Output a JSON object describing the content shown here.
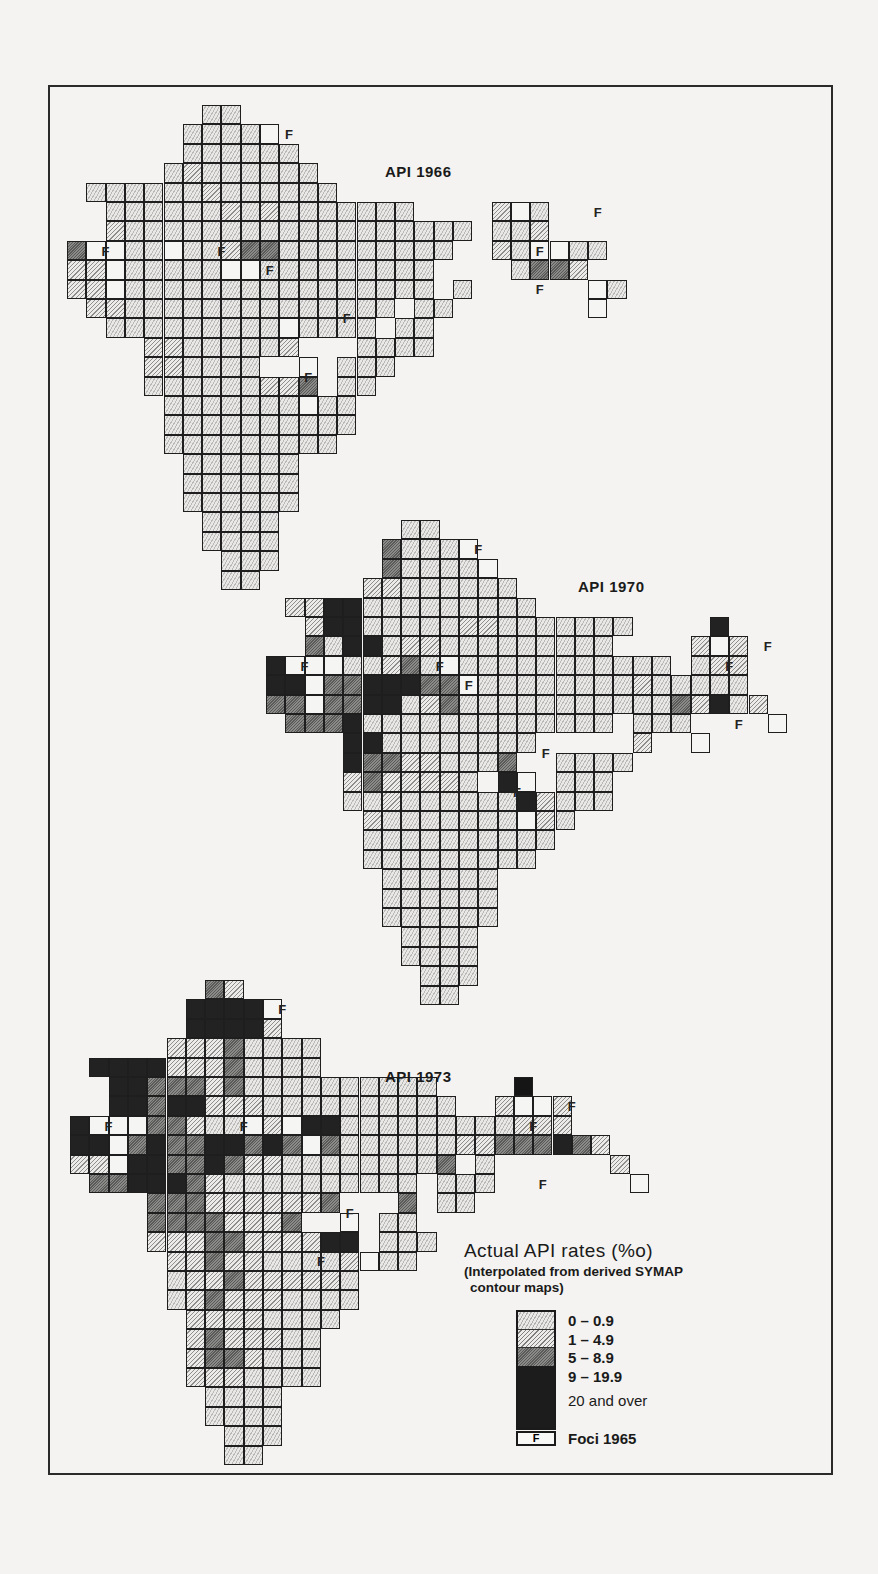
{
  "maps": [
    {
      "id": "m1966",
      "title": "API 1966",
      "origin": [
        67,
        105
      ],
      "title_pos": [
        385,
        163
      ],
      "rows": [
        ".......00",
        "......0000F",
        "......000000",
        ".....01000000",
        ".0000001000000",
        "..0000001010000000....1F0",
        "..1000000000000000000.001",
        "2FF00F00122000000000..10FF00",
        "11F00000FF000000000....0221",
        "11F0000000000000000.0......F0",
        ".1100000000000000.00.......F",
        "..000000000F0000.00",
        "....11000001...0000",
        "....110000..F.000",
        "....000000112.00",
        ".....0000000F00",
        ".....0000000000",
        ".....000000000",
        "......000000",
        "......000000",
        "......000000",
        ".......0000",
        ".......0000",
        "........000",
        "........00"
      ],
      "foci_labels": [
        [
          11,
          1
        ],
        [
          1.5,
          7
        ],
        [
          7.5,
          7
        ],
        [
          10,
          8
        ],
        [
          14,
          10.5
        ],
        [
          12,
          13.5
        ],
        [
          27,
          5
        ],
        [
          24,
          7
        ],
        [
          24,
          9
        ]
      ]
    },
    {
      "id": "m1970",
      "title": "API 1970",
      "origin": [
        266,
        520
      ],
      "title_pos": [
        578,
        578
      ],
      "rows": [
        ".......00",
        "......2000F",
        "......20000F",
        ".....11000000",
        ".1133000000000",
        "..13300000110000000....3",
        "..2033011000000000....1F1",
        "3FFF00120F00000000000.011",
        "33F2233322F00000000100000",
        "22F22330120000000000021301",
        ".22230000000000000.000....F",
        "....3300000000.....1..F",
        "....322110002..0000",
        "....1211110.3F.000",
        "....00100000031000",
        ".....10000000F10",
        ".....0000000000",
        ".....000000000",
        "......000000",
        "......000000",
        "......000000",
        ".......0000",
        ".......0000",
        "........000",
        "........00"
      ],
      "foci_labels": [
        [
          10.5,
          1
        ],
        [
          1.5,
          7
        ],
        [
          8.5,
          7
        ],
        [
          10,
          8
        ],
        [
          14,
          11.5
        ],
        [
          12.5,
          13.5
        ],
        [
          25.5,
          6
        ],
        [
          23.5,
          7
        ],
        [
          24,
          10
        ]
      ]
    },
    {
      "id": "m1973",
      "title": "API 1973",
      "origin": [
        70,
        980
      ],
      "title_pos": [
        385,
        1068
      ],
      "rows": [
        ".......21",
        "......3333F",
        "......33331",
        ".....11120000",
        ".333311120000",
        "..33222120000000000....4",
        "..332331110000000000..1FF1",
        "3FFF22100F1F33000000000111",
        "33F232233232F200000011222321",
        "11F33223211000000002.0......1",
        ".22333210000000000.000.......F",
        "....2221111112...2.00",
        "....22221112..F.00",
        "....11122111133.000",
        ".....1121100001F00",
        ".....0112111110",
        ".....0121110000",
        "......11110000",
        "......1211100",
        "......1221000",
        "......1110000",
        ".......0000",
        ".......0000",
        "........000",
        "........00"
      ],
      "foci_labels": [
        [
          10.5,
          1
        ],
        [
          1.5,
          7
        ],
        [
          8.5,
          7
        ],
        [
          10,
          8
        ],
        [
          14,
          11.5
        ],
        [
          12.5,
          14
        ],
        [
          25.5,
          6
        ],
        [
          23.5,
          7
        ],
        [
          24,
          10
        ]
      ]
    }
  ],
  "legend": {
    "title": "Actual API rates (%o)",
    "subtitle_line1": "(Interpolated from derived SYMAP",
    "subtitle_line2": "contour maps)",
    "classes": [
      {
        "label": "0 – 0.9"
      },
      {
        "label": "1 – 4.9"
      },
      {
        "label": "5 – 8.9"
      },
      {
        "label": "9 – 19.9"
      },
      {
        "label": "20 and over"
      }
    ],
    "foci_symbol": "F",
    "foci_label": "Foci 1965"
  },
  "colors": {
    "border": "#1e1e1e",
    "background": "#f4f3f1",
    "class_0_9_to_19_9": "#222222",
    "class_20_over": "#151515"
  }
}
